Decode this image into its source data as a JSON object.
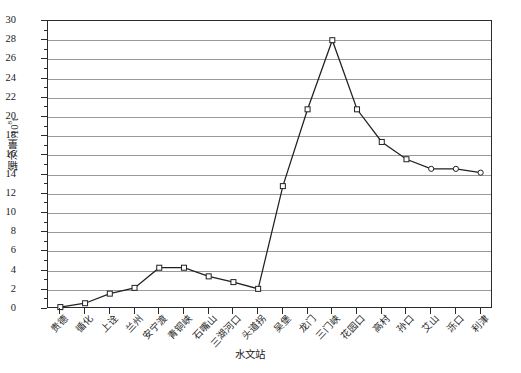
{
  "chart_data": {
    "type": "line",
    "title": "",
    "xlabel": "水文站",
    "ylabel": "输沙量/10⁸t",
    "ylabel_main": "输沙量/10",
    "ylabel_sup": "8",
    "ylabel_unit": "t",
    "ylim": [
      0,
      30
    ],
    "ytick_step": 2,
    "grid": true,
    "legend": "none",
    "categories": [
      "贵德",
      "循化",
      "上诠",
      "兰州",
      "安宁渡",
      "青铜峡",
      "石嘴山",
      "三湖河口",
      "头道拐",
      "吴堡",
      "龙门",
      "三门峡",
      "花园口",
      "高村",
      "孙口",
      "艾山",
      "泺口",
      "利津"
    ],
    "values": [
      0.2,
      0.6,
      1.6,
      2.2,
      4.3,
      4.3,
      3.4,
      2.8,
      2.1,
      12.8,
      20.8,
      28.0,
      20.8,
      17.4,
      15.6,
      14.6,
      14.6,
      14.2
    ],
    "marker_shapes": [
      "square",
      "square",
      "square",
      "square",
      "square",
      "square",
      "square",
      "square",
      "square",
      "square",
      "square",
      "square",
      "square",
      "square",
      "square",
      "circle",
      "circle",
      "circle"
    ],
    "ytick_labels": [
      "0",
      "2",
      "4",
      "6",
      "8",
      "10",
      "12",
      "14",
      "16",
      "18",
      "20",
      "22",
      "24",
      "26",
      "28",
      "30"
    ],
    "colors": {
      "line": "#202020",
      "grid": "#9a9a9a",
      "axis": "#2b2b2b",
      "marker_fill": "#ffffff"
    }
  }
}
